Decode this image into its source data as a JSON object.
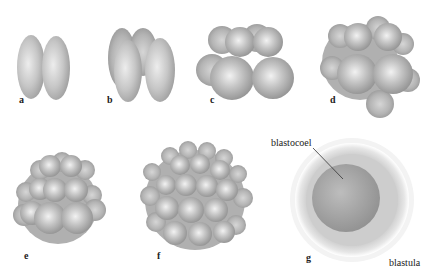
{
  "figure": {
    "panels": [
      {
        "id": "a",
        "label": "a"
      },
      {
        "id": "b",
        "label": "b"
      },
      {
        "id": "c",
        "label": "c"
      },
      {
        "id": "d",
        "label": "d"
      },
      {
        "id": "e",
        "label": "e"
      },
      {
        "id": "f",
        "label": "f"
      },
      {
        "id": "g",
        "label": "g"
      }
    ],
    "annotations": {
      "blastocoel": "blastocoel",
      "blastula": "blastula"
    },
    "colors": {
      "cell_fill": "#b8b8b8",
      "cell_highlight": "#ececec",
      "cell_shadow": "#8e8e8e",
      "blastula_outer": "#d4d4d4",
      "blastocoel_fill": "#a8a8a8"
    }
  }
}
